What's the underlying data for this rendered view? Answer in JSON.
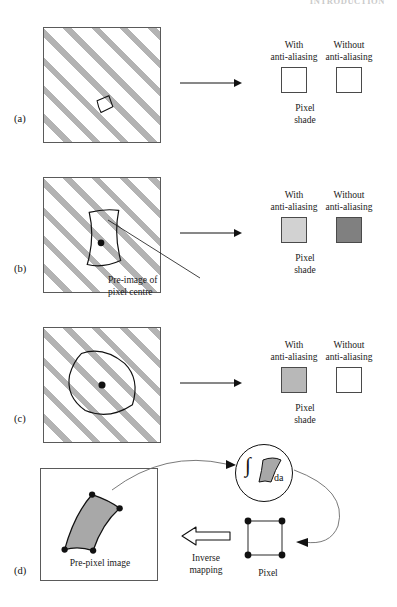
{
  "page": {
    "running_head": "INTRODUCTION",
    "width": 397,
    "height": 607
  },
  "colors": {
    "hatch_stripe": "#b3b3b3",
    "outline": "#5a5a5a",
    "ink": "#111111",
    "swatch_white": "#ffffff",
    "swatch_light_gray": "#d2d2d2",
    "swatch_mid_gray": "#b8b8b8",
    "swatch_dark_gray": "#808080",
    "shape_fill_gray": "#a8a8a8"
  },
  "common": {
    "with_label": "With\nanti-aliasing",
    "without_label": "Without\nanti-aliasing",
    "pixel_shade_label": "Pixel\nshade"
  },
  "panels": [
    {
      "id": "a",
      "label": "(a)",
      "scene": {
        "hatched": true,
        "has_center_dot": false,
        "shape": "tiny-quadrilateral",
        "shape_filled": false
      },
      "with_swatch_color": "#ffffff",
      "without_swatch_color": "#ffffff",
      "with_label": "With\nanti-aliasing",
      "without_label": "Without\nanti-aliasing",
      "pixel_shade_label": "Pixel\nshade"
    },
    {
      "id": "b",
      "label": "(b)",
      "scene": {
        "hatched": true,
        "has_center_dot": true,
        "shape": "tall-curved-quadrilateral",
        "shape_filled": false
      },
      "annotation": "Pre-image of\npixel centre",
      "with_swatch_color": "#d2d2d2",
      "without_swatch_color": "#808080",
      "with_label": "With\nanti-aliasing",
      "without_label": "Without\nanti-aliasing",
      "pixel_shade_label": "Pixel\nshade"
    },
    {
      "id": "c",
      "label": "(c)",
      "scene": {
        "hatched": true,
        "has_center_dot": true,
        "shape": "large-curved-quadrilateral",
        "shape_filled": false
      },
      "with_swatch_color": "#b8b8b8",
      "without_swatch_color": "#ffffff",
      "with_label": "With\nanti-aliasing",
      "without_label": "Without\nanti-aliasing",
      "pixel_shade_label": "Pixel\nshade"
    },
    {
      "id": "d",
      "label": "(d)",
      "prepixel_caption": "Pre-pixel image",
      "inverse_mapping_label": "Inverse\nmapping",
      "pixel_label": "Pixel",
      "integral_symbol": "∫",
      "integral_differential": "da"
    }
  ]
}
